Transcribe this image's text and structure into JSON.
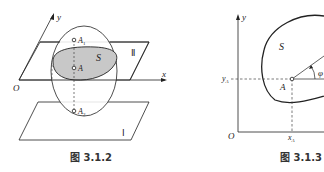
{
  "figures": [
    {
      "caption": "图 3.1.2",
      "labels": {
        "y_axis": "y",
        "x_axis": "x",
        "origin": "O",
        "region": "S",
        "point_a": "A",
        "point_a1": "A",
        "point_a1_sub": "1",
        "point_a2": "A",
        "point_a2_sub": "2",
        "plane_upper": "Ⅱ",
        "plane_lower": "Ⅰ"
      }
    },
    {
      "caption": "图 3.1.3",
      "labels": {
        "y_axis": "y",
        "origin": "O",
        "region": "S",
        "point_a": "A",
        "y_tick": "y",
        "y_tick_sub": "A",
        "x_tick": "x",
        "x_tick_sub": "A",
        "angle": "φ"
      }
    }
  ],
  "colors": {
    "line": "#222222",
    "fill_region": "#c8c8c8",
    "dashed": "#444444"
  }
}
